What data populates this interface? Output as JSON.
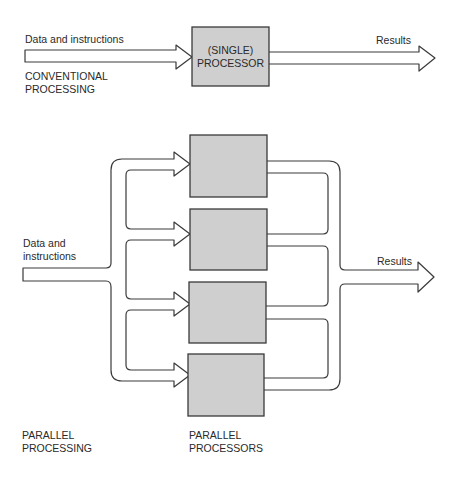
{
  "conventional": {
    "input_label": "Data and instructions",
    "processor_label_line1": "(SINGLE)",
    "processor_label_line2": "PROCESSOR",
    "output_label": "Results",
    "caption_line1": "CONVENTIONAL",
    "caption_line2": "PROCESSING"
  },
  "parallel": {
    "input_label_line1": "Data and",
    "input_label_line2": "instructions",
    "output_label": "Results",
    "processor_count": 4,
    "caption_line1": "PARALLEL",
    "caption_line2": "PROCESSING",
    "processors_caption_line1": "PARALLEL",
    "processors_caption_line2": "PROCESSORS"
  },
  "colors": {
    "processor_fill": "#cfcfcf",
    "stroke": "#3a3a3a",
    "text": "#2a2a2a",
    "background": "#ffffff"
  }
}
